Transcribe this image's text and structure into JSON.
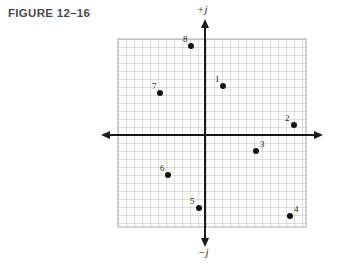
{
  "figure": {
    "title": "FIGURE 12–16"
  },
  "axes": {
    "positive_label": "+j",
    "negative_label": "−j",
    "horizontal_arrow_left": "arrow-left-icon",
    "horizontal_arrow_right": "arrow-right-icon",
    "vertical_arrow_up": "arrow-up-icon",
    "vertical_arrow_down": "arrow-down-icon"
  },
  "colors": {
    "grid_line": "#b9b9b9",
    "grid_line_major": "#9a9a9a",
    "axis_line": "#1a1a1a",
    "point_fill": "#111111",
    "title_text": "#4a4a4a",
    "background": "#ffffff"
  },
  "chart_data": {
    "type": "scatter",
    "title": "FIGURE 12–16",
    "xlabel": "",
    "ylabel": "",
    "grid": true,
    "legend": "none",
    "axis_labels": {
      "up": "+j",
      "down": "−j"
    },
    "xlim": [
      -11,
      13
    ],
    "ylim": [
      -12,
      12
    ],
    "grid_step": 1,
    "points": [
      {
        "label": "1",
        "x": 2,
        "y": 6,
        "px": 223,
        "py": 86,
        "label_dx": -8,
        "label_dy": -11
      },
      {
        "label": "2",
        "x": 11,
        "y": 1,
        "px": 294,
        "py": 125,
        "label_dx": -9,
        "label_dy": -11
      },
      {
        "label": "3",
        "x": 6,
        "y": -2,
        "px": 256,
        "py": 151,
        "label_dx": 4,
        "label_dy": -11
      },
      {
        "label": "4",
        "x": 10,
        "y": -10,
        "px": 290,
        "py": 216,
        "label_dx": 4,
        "label_dy": -11
      },
      {
        "label": "5",
        "x": -1,
        "y": -9,
        "px": 199,
        "py": 208,
        "label_dx": -9,
        "label_dy": -11
      },
      {
        "label": "6",
        "x": -5,
        "y": -5,
        "px": 168,
        "py": 175,
        "label_dx": -8,
        "label_dy": -11
      },
      {
        "label": "7",
        "x": -6,
        "y": 5,
        "px": 160,
        "py": 93,
        "label_dx": -8,
        "label_dy": -11
      },
      {
        "label": "8",
        "x": -2,
        "y": 11,
        "px": 191,
        "py": 46,
        "label_dx": -8,
        "label_dy": -11
      }
    ]
  }
}
